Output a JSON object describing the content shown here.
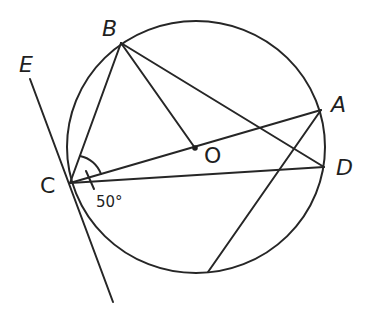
{
  "diagram": {
    "type": "circle-geometry",
    "circle": {
      "center": "O",
      "cx": 196,
      "cy": 147,
      "rx": 129,
      "ry": 126
    },
    "points": {
      "A": {
        "label": "A",
        "x": 321,
        "y": 110,
        "label_x": 333,
        "label_y": 112
      },
      "B": {
        "label": "B",
        "x": 121,
        "y": 43,
        "label_x": 102,
        "label_y": 36
      },
      "C": {
        "label": "C",
        "x": 70,
        "y": 183,
        "label_x": 40,
        "label_y": 193
      },
      "D": {
        "label": "D",
        "x": 324,
        "y": 167,
        "label_x": 336,
        "label_y": 175
      },
      "E": {
        "label": "E",
        "x": 30,
        "y": 79,
        "label_x": 19,
        "label_y": 72
      },
      "O": {
        "label": "O",
        "x": 195,
        "y": 148,
        "label_x": 204,
        "label_y": 162
      }
    },
    "angle_label": "50°",
    "segments": [
      [
        "B",
        "C"
      ],
      [
        "B",
        "O"
      ],
      [
        "B",
        "D"
      ],
      [
        "C",
        "A"
      ],
      [
        "C",
        "D"
      ],
      [
        "A",
        "P"
      ],
      [
        "E",
        "T"
      ]
    ],
    "extra_points": {
      "P": {
        "x": 208,
        "y": 272
      },
      "T": {
        "x": 113,
        "y": 302
      }
    },
    "tangent_line": "EC (tangent at C)"
  }
}
